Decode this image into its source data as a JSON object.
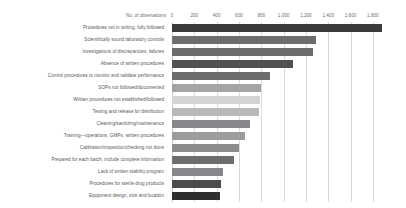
{
  "chart_data": {
    "type": "bar",
    "orientation": "horizontal",
    "title": "",
    "subtitle": "",
    "xlabel": "No. of observations",
    "ylabel": "",
    "xlim": [
      0,
      1900
    ],
    "grid": true,
    "legend": null,
    "xticks": [
      "0",
      "200",
      "400",
      "600",
      "800",
      "1,000",
      "1,200",
      "1,400",
      "1,600",
      "1,800"
    ],
    "xtick_values": [
      0,
      200,
      400,
      600,
      800,
      1000,
      1200,
      1400,
      1600,
      1800
    ],
    "categories": [
      "Procedures not in writing, fully followed",
      "Scientifically sound laboratory controls",
      "Investigations of discrepancies, failures",
      "Absence of written procedures",
      "Control procedures to monitor and validate performance",
      "SOPs not followed/documented",
      "Written procedures not established/followed",
      "Testing and release for distribution",
      "Cleaning/sanitizing/maintenance",
      "Training—operations, GMPs, written procedures",
      "Calibration/inspection/checking not done",
      "Prepared for each batch, include complete information",
      "Lack of written stability program",
      "Procedures for sterile drug products",
      "Equipment design, size and location"
    ],
    "values": [
      1880,
      1290,
      1265,
      1085,
      880,
      800,
      790,
      780,
      700,
      650,
      600,
      560,
      460,
      440,
      430
    ],
    "colors": [
      "#3a3a3c",
      "#6c6d6f",
      "#6c6d6f",
      "#4f5052",
      "#6c6d6f",
      "#a3a4a6",
      "#d3d4d5",
      "#b8b9ba",
      "#86878a",
      "#9b9c9e",
      "#8b8c8e",
      "#6c6d6f",
      "#86878a",
      "#4a4b4d",
      "#2f2f31"
    ]
  }
}
